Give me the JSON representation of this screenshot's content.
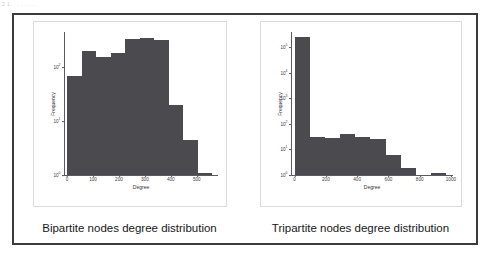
{
  "top_fragment": "2.1.  .  .  .  .  .  .  .",
  "figure": {
    "left": {
      "caption": "Bipartite nodes degree distribution",
      "chart_key": "bipartite"
    },
    "right": {
      "caption": "Tripartite nodes degree distribution",
      "chart_key": "tripartite"
    }
  },
  "chart_data": [
    {
      "id": "bipartite",
      "type": "bar",
      "title": "Bipartite nodes degree distribution",
      "xlabel": "Degree",
      "ylabel": "Frequency",
      "yscale": "log",
      "ylim": [
        1,
        450
      ],
      "xlim": [
        -10,
        580
      ],
      "grid": false,
      "legend": null,
      "xticks": [
        0,
        100,
        200,
        300,
        400,
        500
      ],
      "xtick_labels": [
        "0",
        "100",
        "200",
        "300",
        "400",
        "500"
      ],
      "yticks": [
        1,
        10,
        100
      ],
      "ytick_labels": [
        "10⁰",
        "10¹",
        "10²"
      ],
      "bin_edges": [
        0,
        56,
        112,
        168,
        224,
        280,
        336,
        392,
        448,
        504,
        560
      ],
      "bin_centers": [
        28,
        84,
        140,
        196,
        252,
        308,
        364,
        420,
        476,
        532
      ],
      "values": [
        70,
        200,
        155,
        180,
        330,
        350,
        320,
        20,
        4.5,
        1
      ],
      "bar_color": "#4a4a4f"
    },
    {
      "id": "tripartite",
      "type": "bar",
      "title": "Tripartite nodes degree distribution",
      "xlabel": "Degree",
      "ylabel": "Frequency",
      "yscale": "log",
      "ylim": [
        1,
        400000
      ],
      "xlim": [
        -20,
        1010
      ],
      "grid": false,
      "legend": null,
      "xticks": [
        0,
        200,
        400,
        600,
        800,
        1000
      ],
      "xtick_labels": [
        "0",
        "200",
        "400",
        "600",
        "800",
        "1000"
      ],
      "yticks": [
        1,
        10,
        100,
        1000,
        10000,
        100000
      ],
      "ytick_labels": [
        "10⁰",
        "10¹",
        "10²",
        "10³",
        "10⁴",
        "10⁵"
      ],
      "bin_edges": [
        0,
        97,
        194,
        291,
        388,
        485,
        582,
        679,
        776,
        873,
        970
      ],
      "bin_centers": [
        48,
        145,
        242,
        339,
        436,
        533,
        630,
        727,
        824,
        921
      ],
      "values": [
        250000,
        30,
        28,
        40,
        32,
        25,
        6,
        1.9,
        0,
        1
      ],
      "bar_color": "#4a4a4f"
    }
  ]
}
